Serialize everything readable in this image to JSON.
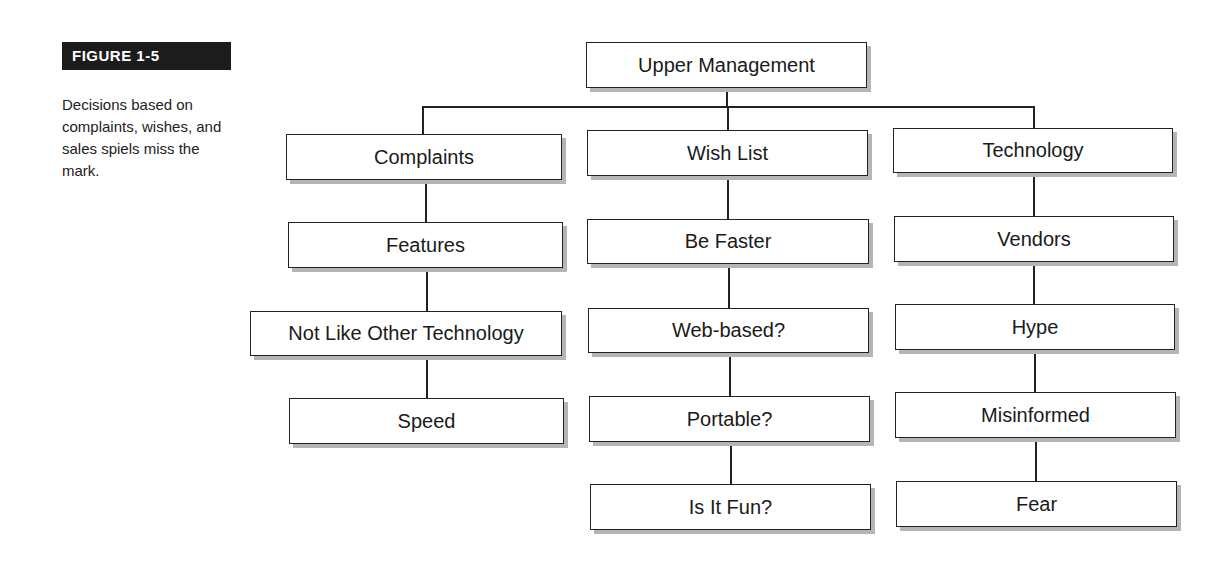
{
  "figure": {
    "label": "FIGURE 1-5",
    "caption": "Decisions based on complaints, wishes, and sales spiels miss the mark."
  },
  "diagram": {
    "root": {
      "label": "Upper Management"
    },
    "columns": [
      {
        "name": "complaints",
        "nodes": [
          {
            "label": "Complaints"
          },
          {
            "label": "Features"
          },
          {
            "label": "Not Like Other Technology"
          },
          {
            "label": "Speed"
          }
        ]
      },
      {
        "name": "wish-list",
        "nodes": [
          {
            "label": "Wish List"
          },
          {
            "label": "Be Faster"
          },
          {
            "label": "Web-based?"
          },
          {
            "label": "Portable?"
          },
          {
            "label": "Is It Fun?"
          }
        ]
      },
      {
        "name": "technology",
        "nodes": [
          {
            "label": "Technology"
          },
          {
            "label": "Vendors"
          },
          {
            "label": "Hype"
          },
          {
            "label": "Misinformed"
          },
          {
            "label": "Fear"
          }
        ]
      }
    ]
  }
}
